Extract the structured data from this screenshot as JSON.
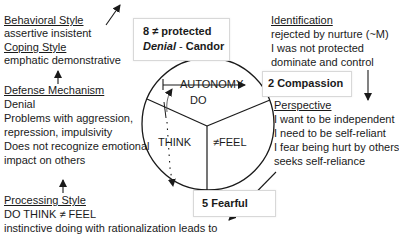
{
  "left_column": {
    "behavioral_style": {
      "heading": "Behavioral Style",
      "text": "assertive insistent"
    },
    "coping_style": {
      "heading": "Coping Style",
      "text": "emphatic demonstrative"
    },
    "defense_mechanism": {
      "heading": "Defense Mechanism",
      "lines": [
        "Denial",
        "Problems  with aggression,",
        "repression, impulsivity",
        "Does not recognize  emotional",
        "impact on others"
      ]
    },
    "processing_style": {
      "heading": "Processing Style",
      "lines": [
        "DO THINK ≠ FEEL",
        "instinctive doing  with rationalization leads to"
      ]
    }
  },
  "right_column": {
    "identification": {
      "heading": "Identification",
      "lines": [
        "rejected by nurture (~M)",
        "I was not protected",
        "dominate and  control"
      ]
    },
    "perspective": {
      "heading": "Perspective",
      "lines": [
        "I want to be independent",
        "I need to be self-reliant",
        "I fear being hurt by others",
        "seeks self-reliance"
      ]
    }
  },
  "boxes": {
    "top": {
      "number_label": "8  ≠ protected",
      "denial": "Denial",
      "separator": " - ",
      "virtue": "Candor"
    },
    "right": {
      "label": "2 Compassion"
    },
    "bottom": {
      "label": "5 Fearful"
    }
  },
  "circle": {
    "autonomy": "AUTONOMY",
    "do": "DO",
    "think": "THINK",
    "feel": "≠FEEL"
  },
  "colors": {
    "line": "#1a1a1a",
    "box_border": "#d8d8d8",
    "text": "#1a1a1a"
  }
}
